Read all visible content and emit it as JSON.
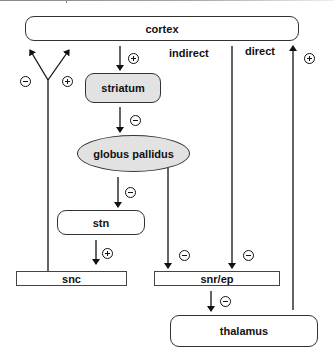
{
  "diagram": {
    "nodes": {
      "cortex": "cortex",
      "striatum": "striatum",
      "globus_pallidus": "globus pallidus",
      "stn": "stn",
      "snc": "snc",
      "snr_ep": "snr/ep",
      "thalamus": "thalamus"
    },
    "path_labels": {
      "indirect": "indirect",
      "direct": "direct"
    },
    "edges": [
      {
        "from": "cortex",
        "to": "striatum",
        "sign": "+"
      },
      {
        "from": "striatum",
        "to": "globus pallidus",
        "sign": "-"
      },
      {
        "from": "globus pallidus",
        "to": "stn",
        "sign": "-"
      },
      {
        "from": "stn",
        "to": "snc",
        "sign": "+"
      },
      {
        "from": "globus pallidus",
        "to": "snr/ep",
        "sign": "-"
      },
      {
        "from": "striatum",
        "to": "snr/ep",
        "sign": "-",
        "label": "direct"
      },
      {
        "from": "snr/ep",
        "to": "thalamus",
        "sign": "-"
      },
      {
        "from": "thalamus",
        "to": "cortex",
        "sign": "+"
      },
      {
        "from": "snc",
        "to": "striatum",
        "sign": "-",
        "branch": "left"
      },
      {
        "from": "snc",
        "to": "striatum",
        "sign": "+",
        "branch": "right"
      }
    ],
    "colors": {
      "node_fill_highlight": "#e2e2e2",
      "node_fill": "#ffffff",
      "stroke": "#111111"
    }
  }
}
